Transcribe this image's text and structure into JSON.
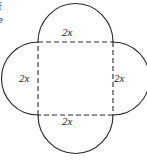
{
  "figure": {
    "type": "geometry-diagram",
    "stroke_color": "#2b2b2b",
    "background_color": "#ffffff",
    "square": {
      "side_label": "2x",
      "edge_style": "dashed"
    },
    "labels": {
      "top": "2x",
      "right": "2x",
      "bottom": "2x",
      "left": "2x"
    },
    "margin_fragments": {
      "line1": "f",
      "line2": "e"
    }
  }
}
